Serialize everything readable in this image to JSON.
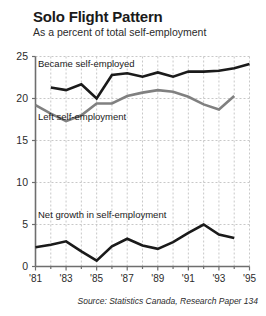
{
  "header": {
    "title": "Solo Flight Pattern",
    "subtitle": "As a percent of total self-employment"
  },
  "footer": {
    "source": "Source: Statistics Canada, Research Paper 134"
  },
  "annotations": {
    "became": "Became self-employed",
    "left": "Left self-employment",
    "net": "Net growth in self-employment"
  },
  "colors": {
    "series_became": "#1a1a1a",
    "series_left": "#808080",
    "series_net": "#1a1a1a",
    "axis": "#6e6e6e",
    "grid": "#c8c8c8",
    "text": "#2b2b2b"
  },
  "chart_data": {
    "type": "line",
    "title": "Solo Flight Pattern",
    "subtitle": "As a percent of total self-employment",
    "xlabel": "",
    "ylabel": "",
    "ylim": [
      0,
      25
    ],
    "xlim": [
      1981,
      1995
    ],
    "grid": true,
    "legend_position": "inline-annotations",
    "ytick_labels": [
      "0",
      "5",
      "10",
      "15",
      "20",
      "25"
    ],
    "ytick_values": [
      0,
      5,
      10,
      15,
      20,
      25
    ],
    "xtick_labels": [
      "'81",
      "'83",
      "'85",
      "'87",
      "'89",
      "'91",
      "'93",
      "'95"
    ],
    "xtick_values": [
      1981,
      1983,
      1985,
      1987,
      1989,
      1991,
      1993,
      1995
    ],
    "xtick_minor_values": [
      1982,
      1984,
      1986,
      1988,
      1990,
      1992,
      1994
    ],
    "series": [
      {
        "name": "Became self-employed",
        "color": "#1a1a1a",
        "x": [
          1982,
          1983,
          1984,
          1985,
          1986,
          1987,
          1988,
          1989,
          1990,
          1991,
          1992,
          1993,
          1994,
          1995
        ],
        "values": [
          21.3,
          21.0,
          21.7,
          20.0,
          22.8,
          23.0,
          22.6,
          23.1,
          22.6,
          23.2,
          23.2,
          23.3,
          23.6,
          24.1
        ]
      },
      {
        "name": "Left self-employment",
        "color": "#808080",
        "x": [
          1981,
          1982,
          1983,
          1984,
          1985,
          1986,
          1987,
          1988,
          1989,
          1990,
          1991,
          1992,
          1993,
          1994
        ],
        "values": [
          19.2,
          18.2,
          17.3,
          18.0,
          19.4,
          19.4,
          20.3,
          20.7,
          21.0,
          20.8,
          20.2,
          19.3,
          18.7,
          20.3
        ]
      },
      {
        "name": "Net growth in self-employment",
        "color": "#1a1a1a",
        "x": [
          1981,
          1982,
          1983,
          1984,
          1985,
          1986,
          1987,
          1988,
          1989,
          1990,
          1991,
          1992,
          1993,
          1994
        ],
        "values": [
          2.3,
          2.6,
          3.0,
          1.8,
          0.7,
          2.4,
          3.3,
          2.5,
          2.1,
          2.9,
          4.0,
          5.0,
          3.8,
          3.4
        ]
      }
    ]
  }
}
